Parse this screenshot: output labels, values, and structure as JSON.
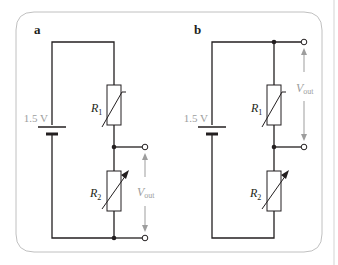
{
  "figure": {
    "panels": [
      {
        "id": "a",
        "label": "a",
        "battery_label": "1.5 V",
        "r1_label": "R",
        "r1_sub": "1",
        "r2_label": "R",
        "r2_sub": "2",
        "vout_label": "V",
        "vout_sub": "out",
        "vout_across": "R2"
      },
      {
        "id": "b",
        "label": "b",
        "battery_label": "1.5 V",
        "r1_label": "R",
        "r1_sub": "1",
        "r2_label": "R",
        "r2_sub": "2",
        "vout_label": "V",
        "vout_sub": "out",
        "vout_across": "R1"
      }
    ],
    "colors": {
      "wire": "#231f20",
      "label_gray": "#9d9d9d",
      "border": "#b0b0b0"
    }
  }
}
